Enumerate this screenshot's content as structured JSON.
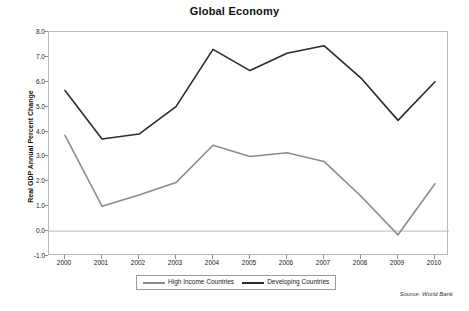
{
  "chart_data": {
    "type": "line",
    "title": "Global Economy",
    "xlabel": "",
    "ylabel": "Real GDP Annual Percent Change",
    "categories": [
      "2000",
      "2001",
      "2002",
      "2003",
      "2004",
      "2005",
      "2006",
      "2007",
      "2008",
      "2009",
      "2010"
    ],
    "x": [
      2000,
      2001,
      2002,
      2003,
      2004,
      2005,
      2006,
      2007,
      2008,
      2009,
      2010
    ],
    "series": [
      {
        "name": "High Income Countries",
        "color": "#8c8c8c",
        "values": [
          3.85,
          1.0,
          1.45,
          1.95,
          3.45,
          3.0,
          3.15,
          2.8,
          1.4,
          -0.15,
          1.9
        ]
      },
      {
        "name": "Developing Countries",
        "color": "#2b2b2b",
        "values": [
          5.65,
          3.7,
          3.9,
          5.0,
          7.3,
          6.45,
          7.15,
          7.45,
          6.15,
          4.45,
          6.0
        ]
      }
    ],
    "ylim": [
      -1.0,
      8.0
    ],
    "ytick_labels": [
      "8.0",
      "7.0",
      "6.0",
      "5.0",
      "4.0",
      "3.0",
      "2.0",
      "1.0",
      "0.0",
      "-1.0"
    ],
    "ytick_values": [
      8.0,
      7.0,
      6.0,
      5.0,
      4.0,
      3.0,
      2.0,
      1.0,
      0.0,
      -1.0
    ],
    "grid": false,
    "zero_line": true,
    "legend_position": "bottom"
  },
  "title": "Global Economy",
  "y_axis_title": "Real GDP Annual Percent Change",
  "legend": {
    "items": [
      {
        "label": "High Income Countries"
      },
      {
        "label": "Developing Countries"
      }
    ]
  },
  "source_note": "Source: World Bank"
}
